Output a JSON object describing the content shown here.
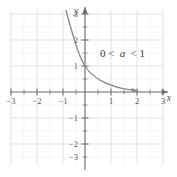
{
  "figure": {
    "background_color": "#ffffff",
    "grid_color": "#e3e3e8",
    "axis_color": "#6b6b6b",
    "curve_color": "#8c8c90",
    "text_color": "#4a4a4a"
  },
  "chart_data": {
    "type": "line",
    "title": "",
    "subtitle": "",
    "xlabel": "x",
    "ylabel": "y",
    "xlim": [
      -3.6,
      3.6
    ],
    "ylim": [
      -3.5,
      3.6
    ],
    "grid": true,
    "minor_grid_step": 0.5,
    "major_tick_step": 1,
    "legend": "none",
    "xticks": [
      -3,
      -2,
      -1,
      1,
      2,
      3
    ],
    "xtick_labels": [
      "−3",
      "−2",
      "−1",
      "1",
      "2",
      "3"
    ],
    "yticks": [
      -3,
      -2,
      -1,
      1,
      2,
      3
    ],
    "ytick_labels": [
      "−3",
      "−2",
      "−1",
      "1",
      "2",
      "3"
    ],
    "annotations": [
      {
        "name": "condition-label",
        "prefix": "0 <",
        "variable": "a",
        "suffix": "< 1",
        "x": 1.35,
        "y": 2.0
      }
    ],
    "series": [
      {
        "name": "exponential-decay",
        "equation": "y = a^x, 0 < a < 1",
        "arrow_end": "right",
        "points": [
          [
            -1.1,
            3.55
          ],
          [
            -1.0,
            3.1
          ],
          [
            -0.85,
            2.62
          ],
          [
            -0.7,
            2.22
          ],
          [
            -0.55,
            1.88
          ],
          [
            -0.4,
            1.6
          ],
          [
            -0.25,
            1.36
          ],
          [
            -0.1,
            1.11
          ],
          [
            0.0,
            1.0
          ],
          [
            0.2,
            0.82
          ],
          [
            0.4,
            0.68
          ],
          [
            0.6,
            0.56
          ],
          [
            0.8,
            0.46
          ],
          [
            1.0,
            0.38
          ],
          [
            1.2,
            0.3
          ],
          [
            1.4,
            0.24
          ],
          [
            1.6,
            0.18
          ],
          [
            1.8,
            0.13
          ]
        ]
      }
    ]
  }
}
